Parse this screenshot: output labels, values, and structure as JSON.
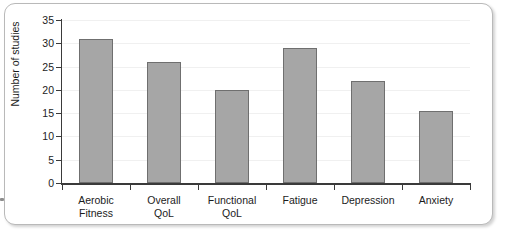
{
  "chart_data": {
    "type": "bar",
    "title": "",
    "xlabel": "",
    "ylabel": "Number of studies",
    "ylim": [
      0,
      35
    ],
    "ytick_step": 5,
    "yticks": [
      "0",
      "5",
      "10",
      "15",
      "20",
      "25",
      "30",
      "35"
    ],
    "grid": true,
    "legend": "none",
    "bar_color": "#a6a6a6",
    "bar_border_color": "#6f6f6f",
    "categories": [
      "Aerobic Fitness",
      "Overall QoL",
      "Functional QoL",
      "Fatigue",
      "Depression",
      "Anxiety"
    ],
    "category_lines": [
      [
        "Aerobic",
        "Fitness"
      ],
      [
        "Overall",
        "QoL"
      ],
      [
        "Functional",
        "QoL"
      ],
      [
        "Fatigue",
        ""
      ],
      [
        "Depression",
        ""
      ],
      [
        "Anxiety",
        ""
      ]
    ],
    "values": [
      31,
      26,
      20,
      29,
      22,
      15.5
    ]
  }
}
